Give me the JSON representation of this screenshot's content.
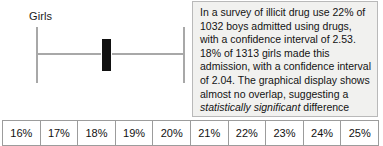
{
  "plot": {
    "series_label": "Girls",
    "marker_name": "point-estimate-marker",
    "line_color": "#a8a8a8",
    "marker_color": "#111111"
  },
  "annotation": {
    "part1": "In a survey of illicit drug use 22% of 1032 boys admitted using drugs, with a confidence interval of 2.53. 18% of 1313 girls made this admission, with a confidence interval of 2.04. The graphical display shows almost no overlap, suggesting a ",
    "emphasis": "statistically significant",
    "part2": " difference between boys and girls which indeed there is.",
    "background_color": "#f1f1ef",
    "border_color": "#b9b9b9"
  },
  "axis": {
    "ticks": [
      "16%",
      "17%",
      "18%",
      "19%",
      "20%",
      "21%",
      "22%",
      "23%",
      "24%",
      "25%"
    ]
  },
  "chart_data": {
    "type": "line",
    "title": "",
    "xlabel": "",
    "ylabel": "",
    "grid": false,
    "legend": "none",
    "xlim": [
      15.5,
      25.5
    ],
    "categories": [
      "Girls"
    ],
    "series": [
      {
        "name": "Girls",
        "point_estimate": 18,
        "confidence_interval": 2.04,
        "lower": 15.96,
        "upper": 20.04,
        "sample_size": 1313
      }
    ],
    "referenced_not_plotted": [
      {
        "name": "Boys",
        "point_estimate": 22,
        "confidence_interval": 2.53,
        "sample_size": 1032
      }
    ],
    "axis_tick_labels": [
      "16%",
      "17%",
      "18%",
      "19%",
      "20%",
      "21%",
      "22%",
      "23%",
      "24%",
      "25%"
    ]
  }
}
